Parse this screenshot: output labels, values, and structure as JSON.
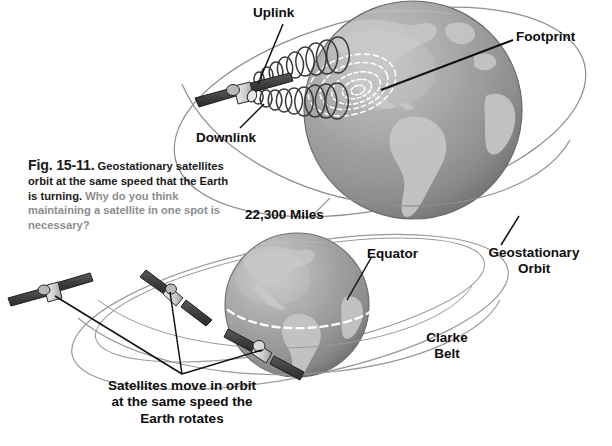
{
  "figure": {
    "caption": {
      "fig_number": "Fig. 15-11.",
      "bold_text": "Geostationary satellites orbit at the same speed that the Earth is turning.",
      "gray_text": "Why do you think maintaining a satellite in one spot is necessary?"
    },
    "labels": {
      "uplink": "Uplink",
      "footprint": "Footprint",
      "downlink": "Downlink",
      "distance": "22,300 Miles",
      "equator": "Equator",
      "geostationary_orbit_line1": "Geostationary",
      "geostationary_orbit_line2": "Orbit",
      "clarke_belt_line1": "Clarke",
      "clarke_belt_line2": "Belt",
      "bottom_note_line1": "Satellites move in orbit",
      "bottom_note_line2": "at the same speed the",
      "bottom_note_line3": "Earth rotates"
    },
    "colors": {
      "background": "#ffffff",
      "text": "#0d0d0d",
      "caption_gray": "#8d8d8d",
      "ocean": "#9a9a9a",
      "land": "#c2c2c2",
      "orbit_line": "#8a8a8a",
      "leader_line": "#111111",
      "footprint": "#ffffff",
      "satellite_body": "#d6d6d6",
      "satellite_panel": "#4a4a4a"
    }
  }
}
